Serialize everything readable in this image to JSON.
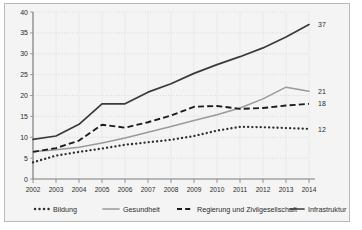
{
  "chart_data": {
    "type": "line",
    "title": "",
    "subtitle": "",
    "xlabel": "",
    "ylabel": "",
    "grid": true,
    "legend_position": "bottom",
    "xlim": [
      2002,
      2014
    ],
    "ylim": [
      0,
      40
    ],
    "ytick_step": 5,
    "yticks": [
      0,
      5,
      10,
      15,
      20,
      25,
      30,
      35,
      40
    ],
    "categories": [
      "2002",
      "2003",
      "2004",
      "2005",
      "2006",
      "2007",
      "2008",
      "2009",
      "2010",
      "2011",
      "2012",
      "2013",
      "2014"
    ],
    "series": [
      {
        "name": "Bildung",
        "style": "dotted",
        "color": "#2e2e2e",
        "values": [
          4.0,
          5.6,
          6.5,
          7.3,
          8.2,
          8.8,
          9.4,
          10.3,
          11.6,
          12.5,
          12.4,
          12.2,
          12.0
        ],
        "end_label": "12"
      },
      {
        "name": "Gesundheit",
        "style": "solid",
        "color": "#9a9a9a",
        "values": [
          6.5,
          7.0,
          7.6,
          8.6,
          9.8,
          11.2,
          12.6,
          14.0,
          15.4,
          17.0,
          19.2,
          22.0,
          21.0
        ],
        "end_label": "21"
      },
      {
        "name": "Regierung und Zivilgesellschaft",
        "style": "dashed",
        "color": "#1c1c1c",
        "values": [
          6.5,
          7.4,
          9.2,
          13.0,
          12.3,
          13.6,
          15.2,
          17.3,
          17.5,
          16.8,
          17.0,
          17.6,
          18.0
        ],
        "end_label": "18"
      },
      {
        "name": "Infrastruktur",
        "style": "solid",
        "color": "#3a3a3a",
        "values": [
          9.5,
          10.3,
          13.1,
          18.0,
          18.0,
          20.8,
          22.8,
          25.3,
          27.4,
          29.3,
          31.4,
          34.0,
          37.0
        ],
        "end_label": "37"
      }
    ],
    "end_labels": [
      "37",
      "21",
      "18",
      "12"
    ]
  },
  "legend": {
    "items": [
      {
        "label": "Bildung",
        "marker": "dotted-line-marker"
      },
      {
        "label": "Gesundheit",
        "marker": "solid-gray-line-marker"
      },
      {
        "label": "Regierung und Zivilgesellschaft",
        "marker": "dashed-line-marker"
      },
      {
        "label": "Infrastruktur",
        "marker": "solid-dark-line-marker"
      }
    ]
  },
  "colors": {
    "background": "#f4f4f4",
    "frame_border": "#b9b9b9",
    "axis": "#8a8a8a",
    "grid": "#cfcfcf",
    "bildung": "#2e2e2e",
    "gesundheit": "#9a9a9a",
    "regierung": "#1c1c1c",
    "infrastruktur": "#3a3a3a"
  }
}
